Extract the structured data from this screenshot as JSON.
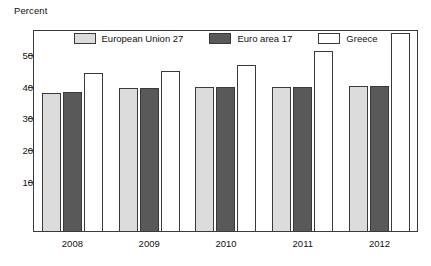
{
  "chart_data": {
    "type": "bar",
    "title": "",
    "subtitle": "",
    "xlabel": "",
    "ylabel": "Percent",
    "unit_label": "Percent",
    "categories": [
      "2008",
      "2009",
      "2010",
      "2011",
      "2012"
    ],
    "series": [
      {
        "name": "European Union 27",
        "color": "#dcdcdc",
        "values": [
          38.0,
          39.5,
          40.0,
          40.0,
          40.3
        ]
      },
      {
        "name": "Euro area 17",
        "color": "#595959",
        "values": [
          38.3,
          39.5,
          40.0,
          40.0,
          40.3
        ]
      },
      {
        "name": "Greece",
        "color": "#ffffff",
        "values": [
          44.5,
          45.0,
          47.0,
          51.5,
          57.0
        ]
      }
    ],
    "ylim": [
      -6,
      58
    ],
    "yticks": [
      10,
      20,
      30,
      40,
      50
    ],
    "ytick_labels": [
      "10",
      "20",
      "30",
      "40",
      "50"
    ],
    "grid": false,
    "legend_position": "top-inside"
  },
  "legend": {
    "items": [
      {
        "label": "European Union 27",
        "color": "#dcdcdc"
      },
      {
        "label": "Euro area 17",
        "color": "#595959"
      },
      {
        "label": "Greece",
        "color": "#ffffff"
      }
    ]
  },
  "axis": {
    "unit": "Percent"
  }
}
